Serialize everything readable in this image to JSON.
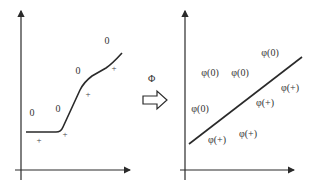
{
  "colors": {
    "stroke": "#2a2a2a",
    "text": "#333333",
    "background": "#ffffff"
  },
  "left_panel": {
    "class_zero_label": "0",
    "class_plus_label": "+",
    "zero_points": [
      {
        "x": 32,
        "y": 116,
        "label": "0"
      },
      {
        "x": 58,
        "y": 112,
        "label": "0"
      },
      {
        "x": 78,
        "y": 74,
        "label": "0"
      },
      {
        "x": 107,
        "y": 44,
        "label": "0"
      }
    ],
    "plus_points": [
      {
        "x": 39,
        "y": 143,
        "label": "+"
      },
      {
        "x": 65,
        "y": 137,
        "label": "+"
      },
      {
        "x": 88,
        "y": 97,
        "label": "+"
      },
      {
        "x": 114,
        "y": 71,
        "label": "+"
      }
    ],
    "boundary": "nonlinear curve"
  },
  "mapping": {
    "symbol": "Φ",
    "arrow": "hollow-right-arrow"
  },
  "right_panel": {
    "zero_points": [
      {
        "x": 210,
        "y": 76,
        "label": "φ(0)"
      },
      {
        "x": 240,
        "y": 76,
        "label": "φ(0)"
      },
      {
        "x": 270,
        "y": 56,
        "label": "φ(0)"
      },
      {
        "x": 200,
        "y": 112,
        "label": "φ(0)"
      }
    ],
    "plus_points": [
      {
        "x": 217,
        "y": 143,
        "label": "φ(+)"
      },
      {
        "x": 248,
        "y": 137,
        "label": "φ(+)"
      },
      {
        "x": 265,
        "y": 106,
        "label": "φ(+)"
      },
      {
        "x": 290,
        "y": 91,
        "label": "φ(+)"
      }
    ],
    "boundary": "linear separator"
  }
}
